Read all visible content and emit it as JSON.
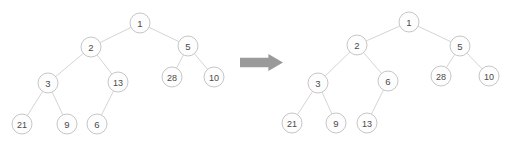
{
  "diagram": {
    "type": "binary-tree-transformation",
    "background_color": "#ffffff",
    "node_fill_color": "#fdfdfd",
    "node_stroke_color": "#c6c6c6",
    "edge_color": "#cfcfcf",
    "label_color": "#4a4a4a",
    "arrow_color": "#9a9a9a",
    "node_radius": 10,
    "arrow": {
      "icon": "right-block-arrow-icon",
      "x": 240,
      "y": 54,
      "width": 43,
      "height": 17
    },
    "panels": [
      {
        "id": "before",
        "name": "tree-before",
        "nodes": [
          {
            "id": "L1",
            "label": "1",
            "x": 140,
            "y": 23
          },
          {
            "id": "L2",
            "label": "2",
            "x": 91,
            "y": 47
          },
          {
            "id": "L5",
            "label": "5",
            "x": 188,
            "y": 46
          },
          {
            "id": "L3",
            "label": "3",
            "x": 48,
            "y": 83
          },
          {
            "id": "L13",
            "label": "13",
            "x": 118,
            "y": 82
          },
          {
            "id": "L28",
            "label": "28",
            "x": 172,
            "y": 77
          },
          {
            "id": "L10",
            "label": "10",
            "x": 214,
            "y": 77
          },
          {
            "id": "L21",
            "label": "21",
            "x": 22,
            "y": 124
          },
          {
            "id": "L9",
            "label": "9",
            "x": 67,
            "y": 124
          },
          {
            "id": "L6",
            "label": "6",
            "x": 97,
            "y": 124
          }
        ],
        "edges": [
          {
            "from": "L1",
            "to": "L2"
          },
          {
            "from": "L1",
            "to": "L5"
          },
          {
            "from": "L2",
            "to": "L3"
          },
          {
            "from": "L2",
            "to": "L13"
          },
          {
            "from": "L5",
            "to": "L28"
          },
          {
            "from": "L5",
            "to": "L10"
          },
          {
            "from": "L3",
            "to": "L21"
          },
          {
            "from": "L3",
            "to": "L9"
          },
          {
            "from": "L13",
            "to": "L6"
          }
        ]
      },
      {
        "id": "after",
        "name": "tree-after",
        "nodes": [
          {
            "id": "R1",
            "label": "1",
            "x": 409,
            "y": 22
          },
          {
            "id": "R2",
            "label": "2",
            "x": 357,
            "y": 45
          },
          {
            "id": "R5",
            "label": "5",
            "x": 460,
            "y": 46
          },
          {
            "id": "R3",
            "label": "3",
            "x": 318,
            "y": 83
          },
          {
            "id": "R6",
            "label": "6",
            "x": 388,
            "y": 81
          },
          {
            "id": "R28",
            "label": "28",
            "x": 441,
            "y": 76
          },
          {
            "id": "R10",
            "label": "10",
            "x": 489,
            "y": 76
          },
          {
            "id": "R21",
            "label": "21",
            "x": 292,
            "y": 123
          },
          {
            "id": "R9",
            "label": "9",
            "x": 336,
            "y": 123
          },
          {
            "id": "R13",
            "label": "13",
            "x": 367,
            "y": 123
          }
        ],
        "edges": [
          {
            "from": "R1",
            "to": "R2"
          },
          {
            "from": "R1",
            "to": "R5"
          },
          {
            "from": "R2",
            "to": "R3"
          },
          {
            "from": "R2",
            "to": "R6"
          },
          {
            "from": "R5",
            "to": "R28"
          },
          {
            "from": "R5",
            "to": "R10"
          },
          {
            "from": "R3",
            "to": "R21"
          },
          {
            "from": "R3",
            "to": "R9"
          },
          {
            "from": "R6",
            "to": "R13"
          }
        ]
      }
    ]
  }
}
